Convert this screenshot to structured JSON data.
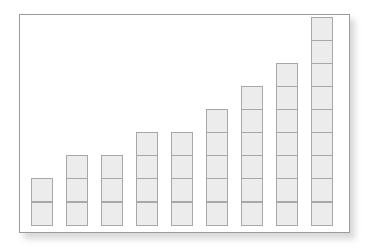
{
  "figure": {
    "name": "stacked-block-bar-chart",
    "background_color": "#ffffff",
    "frame_border_color": "#9b9b9b",
    "frame_background_color": "#ffffff",
    "shadow_color": "#b9b9b9"
  },
  "chart_data": {
    "type": "bar",
    "title": "",
    "subtitle": "",
    "xlabel": "",
    "ylabel": "",
    "categories": [
      "1",
      "2",
      "3",
      "4",
      "5",
      "6",
      "7",
      "8",
      "9"
    ],
    "values": [
      2,
      3,
      3,
      4,
      4,
      5,
      6,
      7,
      9
    ],
    "value_unit": "blocks",
    "ylim": [
      0,
      9
    ],
    "grid": false,
    "legend": null,
    "legend_position": "none",
    "tick_labels_x": [],
    "tick_labels_y": [],
    "annotations": [],
    "style": {
      "block_fill_color": "#ececec",
      "block_border_color": "#a8a8a8",
      "block_height_px": 24,
      "bar_width_px": 22,
      "bar_pitch_px": 35,
      "first_bar_left_px": 11
    }
  }
}
